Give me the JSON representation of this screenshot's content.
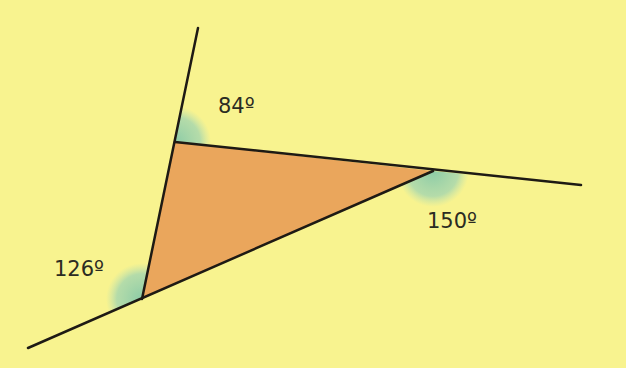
{
  "diagram": {
    "background_color": "#f8f38f",
    "triangle_fill": "#eaa65c",
    "angle_marker_color": "#8fcfb0",
    "line_color": "#1e1a14",
    "vertices": {
      "top": [
        175,
        142
      ],
      "right": [
        433,
        171
      ],
      "bottom_left": [
        142,
        299
      ]
    },
    "extended_lines": [
      {
        "from": [
          142,
          299
        ],
        "to": [
          198,
          28
        ]
      },
      {
        "from": [
          175,
          142
        ],
        "to": [
          581,
          185
        ]
      },
      {
        "from": [
          433,
          171
        ],
        "to": [
          28,
          348
        ]
      }
    ],
    "angles": [
      {
        "label": "84º",
        "vertex": "top"
      },
      {
        "label": "150º",
        "vertex": "right"
      },
      {
        "label": "126º",
        "vertex": "bottom_left"
      }
    ]
  }
}
